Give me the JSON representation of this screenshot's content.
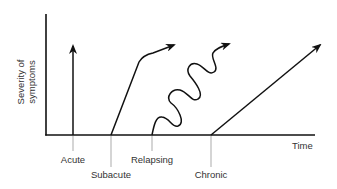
{
  "diagram": {
    "y_axis_label_line1": "Severity of",
    "y_axis_label_line2": "symptoms",
    "x_axis_label": "Time",
    "onset_types": [
      {
        "label": "Acute",
        "shape": "vertical-arrow"
      },
      {
        "label": "Subacute",
        "shape": "steep-rise-then-curve-arrow"
      },
      {
        "label": "Relapsing",
        "shape": "wavy-rising-arrow"
      },
      {
        "label": "Chronic",
        "shape": "gradual-straight-arrow"
      }
    ],
    "colors": {
      "line": "#111111",
      "text": "#333333",
      "tick": "#777777",
      "background": "#ffffff"
    }
  }
}
